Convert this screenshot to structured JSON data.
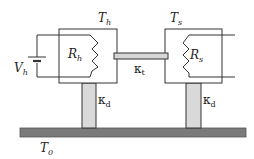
{
  "diagram": {
    "heater": {
      "temperature_label": "T",
      "temperature_sub": "h",
      "resistor_label": "R",
      "resistor_sub": "h"
    },
    "sensor": {
      "temperature_label": "T",
      "temperature_sub": "s",
      "resistor_label": "R",
      "resistor_sub": "s"
    },
    "source": {
      "label": "V",
      "sub": "h"
    },
    "link": {
      "label": "κ",
      "sub": "t"
    },
    "left_support": {
      "label": "κ",
      "sub": "d"
    },
    "right_support": {
      "label": "κ",
      "sub": "d"
    },
    "base": {
      "label": "T",
      "sub": "0"
    },
    "colors": {
      "line": "#333333",
      "link_fill": "#d6d6d6",
      "pillar_fill": "#d9d9d9",
      "base_fill": "#7a7a7a"
    }
  }
}
